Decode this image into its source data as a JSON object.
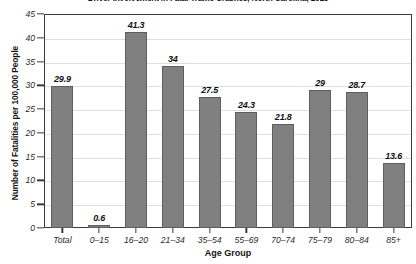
{
  "chart_data": {
    "type": "bar",
    "title": "Driver Involvement in Fatal Traffic Crashes, North Carolina, 2013",
    "xlabel": "Age Group",
    "ylabel": "Number of Fatalities per 100,000 People",
    "categories": [
      "Total",
      "0–15",
      "16–20",
      "21–34",
      "35–54",
      "55–69",
      "70–74",
      "75–79",
      "80–84",
      "85+"
    ],
    "values": [
      29.9,
      0.6,
      41.3,
      34,
      27.5,
      24.3,
      21.8,
      29,
      28.7,
      13.6
    ],
    "value_labels": [
      "29.9",
      "0.6",
      "41.3",
      "34",
      "27.5",
      "24.3",
      "21.8",
      "29",
      "28.7",
      "13.6"
    ],
    "ylim": [
      0,
      45
    ],
    "ytick_step": 5,
    "ytick_labels": [
      "0",
      "5",
      "10",
      "15",
      "20",
      "25",
      "30",
      "35",
      "40",
      "45"
    ],
    "grid": "horizontal",
    "legend": "none",
    "bar_color": "#808080",
    "bar_edge_color": "#5e5e5e",
    "grid_color": "#dedede",
    "axis_color": "#3a3a3a"
  }
}
